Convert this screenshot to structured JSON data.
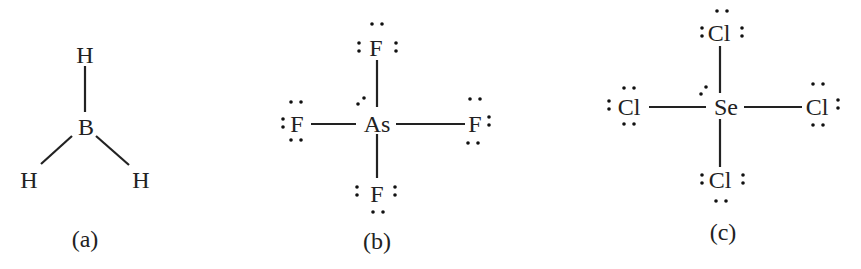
{
  "figure": {
    "structures": [
      {
        "label": "(a)",
        "molecule": "BH3",
        "central_atom": "B",
        "atoms": [
          "H",
          "B",
          "H",
          "H"
        ],
        "geometry": "trigonal planar"
      },
      {
        "label": "(b)",
        "molecule": "AsF4",
        "central_atom": "As",
        "atoms": [
          "F",
          "F",
          "As",
          "F",
          "F"
        ],
        "central_lone_electrons": 2,
        "geometry": "see-saw (drawn as cross)"
      },
      {
        "label": "(c)",
        "molecule": "SeCl4",
        "central_atom": "Se",
        "atoms": [
          "Cl",
          "Cl",
          "Se",
          "Cl",
          "Cl"
        ],
        "central_lone_electrons": 2,
        "geometry": "see-saw (drawn as cross)"
      }
    ],
    "colors": {
      "ink": "#222222",
      "background": "#ffffff"
    }
  }
}
